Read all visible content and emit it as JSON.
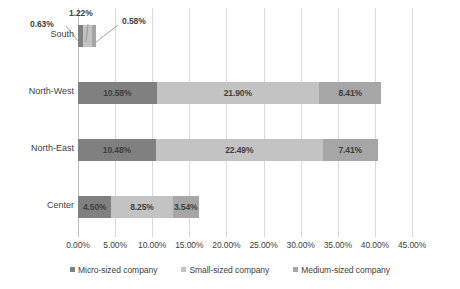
{
  "chart_data": {
    "type": "bar",
    "orientation": "horizontal",
    "stacked": true,
    "title": "",
    "xlabel": "",
    "ylabel": "",
    "xlim": [
      0,
      45
    ],
    "xtick_step": 5,
    "grid": true,
    "legend_position": "bottom",
    "value_suffix": "%",
    "categories": [
      "South",
      "North-West",
      "North-East",
      "Center"
    ],
    "xtick_labels": [
      "0.00%",
      "5.00%",
      "10.00%",
      "15.00%",
      "20.00%",
      "25.00%",
      "30.00%",
      "35.00%",
      "40.00%",
      "45.00%"
    ],
    "xtick_values": [
      0,
      5,
      10,
      15,
      20,
      25,
      30,
      35,
      40,
      45
    ],
    "series": [
      {
        "name": "Micro-sized company",
        "color": "#808080",
        "values": [
          0.63,
          10.58,
          10.48,
          4.5
        ],
        "labels": [
          "0.63%",
          "10.58%",
          "10.48%",
          "4.50%"
        ]
      },
      {
        "name": "Small-sized company",
        "color": "#c3c3c3",
        "values": [
          1.22,
          21.9,
          22.49,
          8.25
        ],
        "labels": [
          "1.22%",
          "21.90%",
          "22.49%",
          "8.25%"
        ]
      },
      {
        "name": "Medium-sized company",
        "color": "#a6a6a6",
        "values": [
          0.58,
          8.41,
          7.41,
          3.54
        ],
        "labels": [
          "0.58%",
          "8.41%",
          "7.41%",
          "3.54%"
        ]
      }
    ],
    "totals": [
      2.43,
      40.89,
      40.38,
      16.29
    ],
    "callouts": [
      {
        "label": "0.63%",
        "category": "South",
        "series": "Micro-sized company"
      },
      {
        "label": "1.22%",
        "category": "South",
        "series": "Small-sized company"
      },
      {
        "label": "0.58%",
        "category": "South",
        "series": "Medium-sized company"
      }
    ]
  },
  "legend": {
    "items": [
      {
        "label": "Micro-sized company",
        "color": "#808080"
      },
      {
        "label": "Small-sized company",
        "color": "#c3c3c3"
      },
      {
        "label": "Medium-sized company",
        "color": "#a6a6a6"
      }
    ]
  },
  "axis": {
    "ticks": [
      "0.00%",
      "5.00%",
      "10.00%",
      "15.00%",
      "20.00%",
      "25.00%",
      "30.00%",
      "35.00%",
      "40.00%",
      "45.00%"
    ]
  },
  "categories": {
    "south": "South",
    "north_west": "North-West",
    "north_east": "North-East",
    "center": "Center"
  },
  "callout_labels": {
    "micro": "0.63%",
    "small": "1.22%",
    "medium": "0.58%"
  }
}
